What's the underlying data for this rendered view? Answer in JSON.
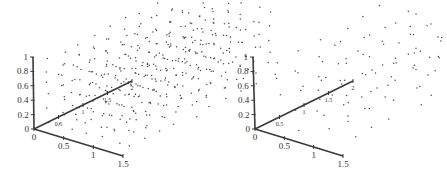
{
  "chart_data": [
    {
      "type": "scatter",
      "subtype": "3d-point-lattice",
      "title": "",
      "density": "dense",
      "axes": {
        "z": {
          "label": "",
          "ticks": [
            "0",
            "0.2",
            "0.4",
            "0.6",
            "0.8",
            "1"
          ],
          "range": [
            0,
            1
          ]
        },
        "x": {
          "label": "",
          "ticks": [
            "0",
            "0.5",
            "1",
            "1.5"
          ],
          "range": [
            0,
            1.5
          ]
        },
        "y": {
          "label": "",
          "ticks": [
            "0.5",
            "1",
            "1.5",
            "2"
          ],
          "range": [
            0,
            2
          ]
        }
      },
      "grid": false,
      "legend": null,
      "point_layout": {
        "nx": 7,
        "ny": 10,
        "nz": 6,
        "jitter": 0.35
      }
    },
    {
      "type": "scatter",
      "subtype": "3d-point-lattice",
      "title": "",
      "density": "sparse",
      "axes": {
        "z": {
          "label": "",
          "ticks": [
            "0",
            "0.2",
            "0.4",
            "0.6",
            "0.8",
            "1"
          ],
          "range": [
            0,
            1
          ]
        },
        "x": {
          "label": "",
          "ticks": [
            "0",
            "0.5",
            "1",
            "1.5"
          ],
          "range": [
            0,
            1.5
          ]
        },
        "y": {
          "label": "",
          "ticks": [
            "0.5",
            "1",
            "1.5",
            "2"
          ],
          "range": [
            0,
            2
          ]
        }
      },
      "grid": false,
      "legend": null,
      "point_layout": {
        "nx": 4,
        "ny": 7,
        "nz": 4,
        "jitter": 0.45
      }
    }
  ],
  "panels": [
    {
      "origin": [
        34,
        129
      ],
      "zTop": [
        33,
        57
      ],
      "xEnd": [
        123,
        156
      ],
      "yEnd": [
        132,
        81
      ]
    },
    {
      "origin": [
        255,
        129
      ],
      "zTop": [
        253,
        57
      ],
      "xEnd": [
        343,
        156
      ],
      "yEnd": [
        353,
        81
      ]
    }
  ]
}
